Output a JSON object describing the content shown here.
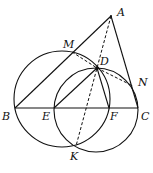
{
  "diagram": {
    "type": "geometry",
    "points": {
      "A": {
        "label": "A",
        "x": 111,
        "y": 16
      },
      "B": {
        "label": "B",
        "x": 15,
        "y": 108
      },
      "C": {
        "label": "C",
        "x": 138,
        "y": 108
      },
      "D": {
        "label": "D",
        "x": 97,
        "y": 68
      },
      "E": {
        "label": "E",
        "x": 54,
        "y": 108
      },
      "F": {
        "label": "F",
        "x": 109,
        "y": 108
      },
      "K": {
        "label": "K",
        "x": 76,
        "y": 146
      },
      "M": {
        "label": "M",
        "x": 72,
        "y": 52
      },
      "N": {
        "label": "N",
        "x": 133,
        "y": 86
      }
    },
    "segments_solid": [
      "AB",
      "AC",
      "BC",
      "ED",
      "DF"
    ],
    "segments_dashed": [
      "AK",
      "MD",
      "DN"
    ],
    "circles": [
      {
        "name": "circle-BFM",
        "through": [
          "B",
          "M",
          "D",
          "F",
          "K"
        ],
        "cx": 62,
        "cy": 99,
        "r": 48
      },
      {
        "name": "circle-ECD",
        "through": [
          "E",
          "D",
          "N",
          "C",
          "K"
        ],
        "cx": 96,
        "cy": 110,
        "r": 42
      }
    ]
  }
}
